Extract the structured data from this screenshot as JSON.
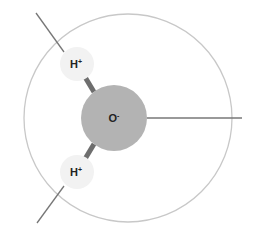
{
  "diagram": {
    "title": "",
    "type": "water molecule / hydroxide ion schematic",
    "atoms": [
      {
        "id": "oxygen",
        "label": "O",
        "charge": "-",
        "color": "#b3b3b3"
      },
      {
        "id": "hydrogen-top",
        "label": "H",
        "charge": "+",
        "color": "#f2f2f2"
      },
      {
        "id": "hydrogen-bottom",
        "label": "H",
        "charge": "+",
        "color": "#f2f2f2"
      }
    ],
    "colors": {
      "outer_circle": "#c8c8c8",
      "bond": "#6e6e6e",
      "pointer_line": "#777777",
      "text": "#222222"
    }
  }
}
